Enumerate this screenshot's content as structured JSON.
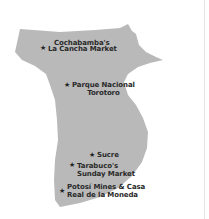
{
  "map": {
    "region_fill": "#b8b8b8",
    "background": "#ffffff",
    "marker_icon": "star",
    "places": [
      {
        "lines": [
          "Cochabamba's",
          "La Cancha Market"
        ]
      },
      {
        "lines": [
          "Parque Nacional",
          "Torotoro"
        ]
      },
      {
        "lines": [
          "Sucre"
        ]
      },
      {
        "lines": [
          "Tarabuco's",
          "Sunday Market"
        ]
      },
      {
        "lines": [
          "Potosí Mines & Casa",
          "Real de la Moneda"
        ]
      }
    ]
  }
}
